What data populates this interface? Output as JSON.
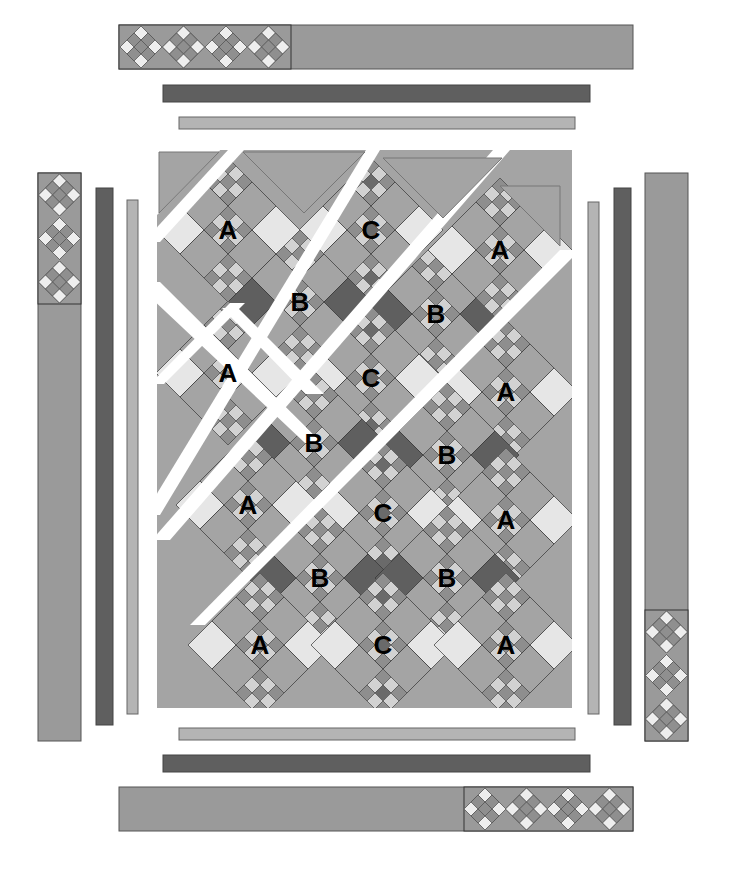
{
  "diagram": {
    "colors": {
      "background": "#ffffff",
      "medium": "#a4a4a4",
      "border_medium": "#9a9a9a",
      "dark": "#5f5f5f",
      "dark_border": "#5a5a5a",
      "light_border": "#b4b4b4",
      "light": "#e6e6e6",
      "mini_light": "#d2d2d2",
      "mini_mid": "#8e8e8e",
      "c_center": "#6a6a6a",
      "outline": "#333333",
      "gap": "#ffffff",
      "label": "#000000"
    },
    "block_labels": {
      "row1": [
        "A",
        "C"
      ],
      "row2": [
        "B",
        "B",
        "A"
      ],
      "row3": [
        "A",
        "C"
      ],
      "row4": [
        "B",
        "B",
        "A"
      ],
      "row5": [
        "A",
        "C",
        "A"
      ],
      "row6": [
        "B",
        "B"
      ],
      "row7": [
        "A",
        "C",
        "A"
      ]
    },
    "blocks": [
      {
        "label": "A",
        "cx": 228,
        "cy": 230,
        "type": "A"
      },
      {
        "label": "C",
        "cx": 371,
        "cy": 230,
        "type": "C"
      },
      {
        "label": "B",
        "cx": 300,
        "cy": 302,
        "type": "B"
      },
      {
        "label": "B",
        "cx": 436,
        "cy": 314,
        "type": "B"
      },
      {
        "label": "A",
        "cx": 500,
        "cy": 250,
        "type": "A"
      },
      {
        "label": "A",
        "cx": 228,
        "cy": 373,
        "type": "A"
      },
      {
        "label": "C",
        "cx": 371,
        "cy": 378,
        "type": "C"
      },
      {
        "label": "A",
        "cx": 506,
        "cy": 392,
        "type": "A"
      },
      {
        "label": "B",
        "cx": 314,
        "cy": 443,
        "type": "B"
      },
      {
        "label": "B",
        "cx": 447,
        "cy": 455,
        "type": "B"
      },
      {
        "label": "A",
        "cx": 248,
        "cy": 505,
        "type": "A"
      },
      {
        "label": "C",
        "cx": 383,
        "cy": 513,
        "type": "C"
      },
      {
        "label": "A",
        "cx": 506,
        "cy": 520,
        "type": "A"
      },
      {
        "label": "B",
        "cx": 320,
        "cy": 578,
        "type": "B"
      },
      {
        "label": "B",
        "cx": 447,
        "cy": 578,
        "type": "B"
      },
      {
        "label": "A",
        "cx": 260,
        "cy": 645,
        "type": "A"
      },
      {
        "label": "C",
        "cx": 383,
        "cy": 645,
        "type": "C"
      },
      {
        "label": "A",
        "cx": 506,
        "cy": 645,
        "type": "A"
      }
    ],
    "borders": {
      "top_outer": {
        "label": "top-outer-border-with-ninepatch",
        "ninepatch_count": 4
      },
      "top_dark": {
        "label": "top-dark-border"
      },
      "top_inner": {
        "label": "top-inner-border"
      },
      "left_outer": {
        "label": "left-outer-border-with-ninepatch",
        "ninepatch_count": 3
      },
      "left_dark": {
        "label": "left-dark-border"
      },
      "left_inner": {
        "label": "left-inner-border"
      },
      "right_outer": {
        "label": "right-outer-border-with-ninepatch",
        "ninepatch_count": 3
      },
      "right_dark": {
        "label": "right-dark-border"
      },
      "right_inner": {
        "label": "right-inner-border"
      },
      "bottom_outer": {
        "label": "bottom-outer-border-with-ninepatch",
        "ninepatch_count": 4
      },
      "bottom_dark": {
        "label": "bottom-dark-border"
      },
      "bottom_inner": {
        "label": "bottom-inner-border"
      }
    }
  }
}
